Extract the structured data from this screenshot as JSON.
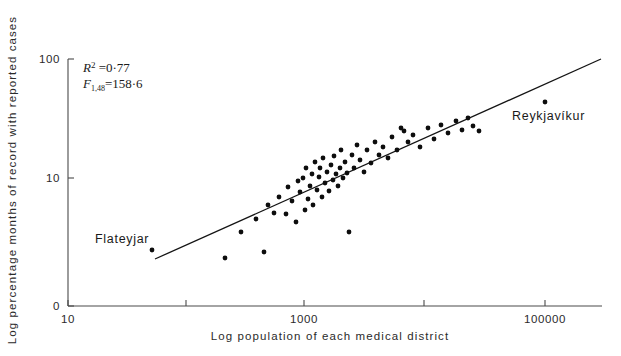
{
  "chart_data": {
    "type": "scatter",
    "title": "",
    "xlabel": "Log population of each medical district",
    "ylabel": "Log percentage months of record with reported cases",
    "x_scale": "log",
    "y_scale": "log",
    "grid": false,
    "legend": "none",
    "x_ticks": [
      {
        "value": 10,
        "label": "10"
      },
      {
        "value": 100,
        "label": ""
      },
      {
        "value": 1000,
        "label": "1000"
      },
      {
        "value": 10000,
        "label": ""
      },
      {
        "value": 100000,
        "label": "100000"
      }
    ],
    "y_ticks": [
      {
        "value": 0,
        "label": "0"
      },
      {
        "value": 10,
        "label": "10"
      },
      {
        "value": 100,
        "label": "100"
      }
    ],
    "xlim": [
      10,
      300000
    ],
    "ylim": [
      0,
      160
    ],
    "annotations": [
      {
        "name": "r-squared",
        "text": "R2 = 0·77",
        "x_px": 83,
        "y_px": 72
      },
      {
        "name": "f-statistic",
        "text": "F1,48 = 158·6",
        "x_px": 83,
        "y_px": 88
      }
    ],
    "point_labels": [
      {
        "name": "Flateyjar",
        "label": "Flateyjar",
        "x_px": 95,
        "y_px": 243
      },
      {
        "name": "Reykjavíkur",
        "label": "Reykjavíkur",
        "x_px": 512,
        "y_px": 120
      }
    ],
    "regression_line": {
      "x1_px": 155,
      "y1_px": 259,
      "x2_px": 601,
      "y2_px": 59,
      "equation_note": "least-squares fit on log-log axes"
    },
    "points_px": [
      [
        152,
        250
      ],
      [
        225,
        258
      ],
      [
        264,
        252
      ],
      [
        241,
        232
      ],
      [
        256,
        219
      ],
      [
        268,
        205
      ],
      [
        274,
        213
      ],
      [
        279,
        197
      ],
      [
        286,
        214
      ],
      [
        288,
        187
      ],
      [
        292,
        201
      ],
      [
        296,
        222
      ],
      [
        298,
        181
      ],
      [
        300,
        192
      ],
      [
        303,
        178
      ],
      [
        305,
        210
      ],
      [
        306,
        168
      ],
      [
        308,
        199
      ],
      [
        310,
        186
      ],
      [
        312,
        174
      ],
      [
        313,
        205
      ],
      [
        315,
        162
      ],
      [
        317,
        190
      ],
      [
        319,
        177
      ],
      [
        320,
        168
      ],
      [
        322,
        197
      ],
      [
        323,
        158
      ],
      [
        325,
        183
      ],
      [
        327,
        172
      ],
      [
        329,
        191
      ],
      [
        331,
        165
      ],
      [
        333,
        180
      ],
      [
        334,
        156
      ],
      [
        336,
        174
      ],
      [
        338,
        186
      ],
      [
        340,
        168
      ],
      [
        341,
        150
      ],
      [
        343,
        178
      ],
      [
        345,
        162
      ],
      [
        347,
        173
      ],
      [
        349,
        232
      ],
      [
        352,
        155
      ],
      [
        354,
        168
      ],
      [
        357,
        145
      ],
      [
        360,
        160
      ],
      [
        364,
        172
      ],
      [
        367,
        150
      ],
      [
        371,
        163
      ],
      [
        375,
        142
      ],
      [
        379,
        155
      ],
      [
        383,
        147
      ],
      [
        388,
        158
      ],
      [
        392,
        137
      ],
      [
        397,
        150
      ],
      [
        401,
        128
      ],
      [
        404,
        131
      ],
      [
        408,
        142
      ],
      [
        413,
        135
      ],
      [
        420,
        147
      ],
      [
        428,
        128
      ],
      [
        434,
        139
      ],
      [
        441,
        125
      ],
      [
        448,
        133
      ],
      [
        456,
        121
      ],
      [
        462,
        130
      ],
      [
        468,
        118
      ],
      [
        473,
        126
      ],
      [
        479,
        131
      ],
      [
        545,
        102
      ]
    ]
  },
  "axis_label_style": {
    "tick_font_px": 11.5,
    "title_font_px": 11.5
  }
}
